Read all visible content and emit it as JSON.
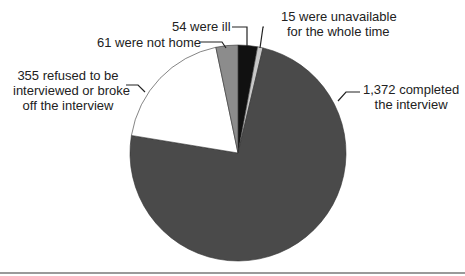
{
  "chart_data": {
    "type": "pie",
    "title": "",
    "start_angle_deg": 0,
    "direction": "clockwise",
    "total": 1857,
    "slices": [
      {
        "label": "54 were ill",
        "value": 54,
        "color": "#111111"
      },
      {
        "label": "15 were unavailable for the whole time",
        "value": 15,
        "color": "#c8c8c8"
      },
      {
        "label": "1,372 completed the interview",
        "value": 1372,
        "color": "#4a4a4a"
      },
      {
        "label": "355 refused to be interviewed or broke off the interview",
        "value": 355,
        "color": "#ffffff"
      },
      {
        "label": "61 were not home",
        "value": 61,
        "color": "#8c8c8c"
      }
    ]
  },
  "labels": {
    "ill": "54 were ill",
    "unavailable_1": "15 were unavailable",
    "unavailable_2": "for the whole time",
    "completed_1": "1,372 completed",
    "completed_2": "the interview",
    "refused_1": "355 refused to be",
    "refused_2": "interviewed or broke",
    "refused_3": "off the interview",
    "not_home": "61 were not home"
  }
}
